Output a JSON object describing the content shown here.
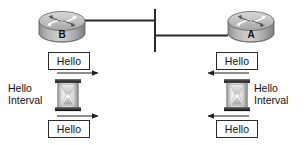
{
  "diagram": {
    "type": "network-topology",
    "background_color": "#ffffff",
    "line_color": "#2a2a2a",
    "box_border_color": "#2a2a2a",
    "router_body_color": "#9a9a9a",
    "router_top_color": "#c9c9c9"
  },
  "routers": [
    {
      "id": "router-b",
      "label": "B",
      "side": "left"
    },
    {
      "id": "router-a",
      "label": "A",
      "side": "right"
    }
  ],
  "link": {
    "name": "shared-segment",
    "description": "vertical segment bar joining both router links"
  },
  "left_side": {
    "hello_top": "Hello",
    "hello_bottom": "Hello",
    "interval_label": "Hello\nInterval",
    "arrow_direction": "right",
    "timer_icon": "hourglass-icon"
  },
  "right_side": {
    "hello_top": "Hello",
    "hello_bottom": "Hello",
    "interval_label": "Hello\nInterval",
    "arrow_direction": "left",
    "timer_icon": "hourglass-icon"
  }
}
